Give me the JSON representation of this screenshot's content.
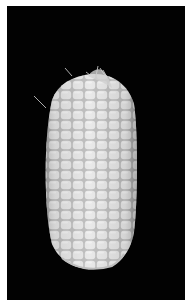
{
  "image": {
    "subject": "white corn cob",
    "background_color": "#020202",
    "border_color": "#ffffff",
    "kernel_color": "#e8e8e8",
    "kernel_shadow": "#9a9a9a"
  }
}
